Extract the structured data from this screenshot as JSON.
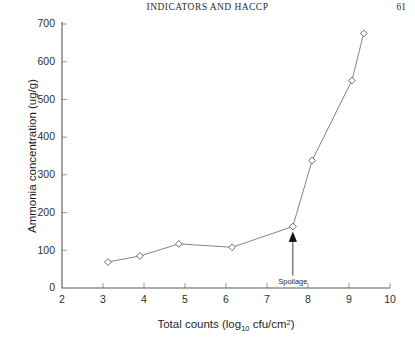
{
  "running_head": {
    "title": "INDICATORS AND HACCP",
    "page_number": "61"
  },
  "chart_data": {
    "type": "line",
    "title": "",
    "xlabel": "Total counts (log10 cfu/cm2)",
    "xlabel_main": "Total counts (log",
    "xlabel_sub": "10",
    "xlabel_tail": " cfu/cm",
    "xlabel_sup": "2",
    "xlabel_close": ")",
    "ylabel": "Ammonia concentration (ug/g)",
    "xlim": [
      2,
      10
    ],
    "ylim": [
      0,
      700
    ],
    "xticks": [
      2,
      3,
      4,
      5,
      6,
      7,
      8,
      9,
      10
    ],
    "xtick_labels": [
      "2",
      "3",
      "4",
      "5",
      "6",
      "7",
      "8",
      "9",
      "10"
    ],
    "yticks": [
      0,
      100,
      200,
      300,
      400,
      500,
      600,
      700
    ],
    "ytick_labels": [
      "0",
      "100",
      "200",
      "300",
      "400",
      "500",
      "600",
      "700"
    ],
    "grid": false,
    "legend": false,
    "marker": "open-diamond",
    "series": [
      {
        "name": "Ammonia concentration",
        "x": [
          3.12,
          3.9,
          4.85,
          6.15,
          7.63,
          8.1,
          9.07,
          9.36
        ],
        "y": [
          69,
          85,
          117,
          108,
          163,
          338,
          550,
          675
        ]
      }
    ],
    "annotations": [
      {
        "label": "Spoilage",
        "x": 7.63,
        "y": 163,
        "arrow": "up",
        "label_x": 7.63,
        "label_y": 38
      }
    ]
  }
}
